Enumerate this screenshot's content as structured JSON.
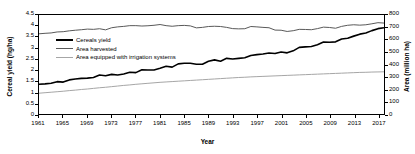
{
  "chart_data": {
    "type": "line",
    "title": "",
    "xlabel": "Year",
    "ylabel": "Cereal yield (hg/ha)",
    "ylabel_right": "Area (million ha)",
    "xlim": [
      1961,
      2018
    ],
    "ylim": [
      0,
      4.5
    ],
    "ylim_right": [
      0,
      800
    ],
    "grid": false,
    "legend_position": "upper-left-inside",
    "xticks": [
      "1961",
      "1965",
      "1969",
      "1973",
      "1977",
      "1981",
      "1985",
      "1989",
      "1993",
      "1997",
      "2001",
      "2005",
      "2009",
      "2013",
      "2017"
    ],
    "yticks_left": [
      "0",
      "0.5",
      "1",
      "1.5",
      "2",
      "2.5",
      "3",
      "3.5",
      "4",
      "4.5"
    ],
    "yticks_right": [
      "0",
      "100",
      "200",
      "300",
      "400",
      "500",
      "600",
      "700",
      "800"
    ],
    "x": [
      1961,
      1962,
      1963,
      1964,
      1965,
      1966,
      1967,
      1968,
      1969,
      1970,
      1971,
      1972,
      1973,
      1974,
      1975,
      1976,
      1977,
      1978,
      1979,
      1980,
      1981,
      1982,
      1983,
      1984,
      1985,
      1986,
      1987,
      1988,
      1989,
      1990,
      1991,
      1992,
      1993,
      1994,
      1995,
      1996,
      1997,
      1998,
      1999,
      2000,
      2001,
      2002,
      2003,
      2004,
      2005,
      2006,
      2007,
      2008,
      2009,
      2010,
      2011,
      2012,
      2013,
      2014,
      2015,
      2016,
      2017,
      2018
    ],
    "series": [
      {
        "name": "Cereals yield",
        "axis": "left",
        "unit": "hg/ha",
        "color": "#000000",
        "linewidth": 1.6,
        "values": [
          1.35,
          1.37,
          1.4,
          1.47,
          1.45,
          1.55,
          1.59,
          1.62,
          1.63,
          1.66,
          1.77,
          1.74,
          1.8,
          1.77,
          1.82,
          1.9,
          1.88,
          2.01,
          2.0,
          2.0,
          2.08,
          2.17,
          2.13,
          2.28,
          2.31,
          2.31,
          2.26,
          2.26,
          2.4,
          2.46,
          2.4,
          2.53,
          2.5,
          2.53,
          2.56,
          2.66,
          2.7,
          2.73,
          2.77,
          2.75,
          2.82,
          2.78,
          2.87,
          3.03,
          3.05,
          3.07,
          3.15,
          3.27,
          3.26,
          3.28,
          3.41,
          3.44,
          3.54,
          3.63,
          3.68,
          3.79,
          3.88,
          3.92
        ]
      },
      {
        "name": "Area harvested",
        "axis": "right",
        "unit": "million ha",
        "color": "#595959",
        "linewidth": 1.0,
        "values": [
          648,
          652,
          655,
          663,
          665,
          672,
          677,
          681,
          686,
          684,
          689,
          680,
          697,
          704,
          708,
          714,
          714,
          711,
          713,
          717,
          723,
          714,
          709,
          714,
          716,
          712,
          696,
          700,
          707,
          709,
          707,
          700,
          690,
          688,
          689,
          707,
          704,
          700,
          697,
          678,
          677,
          667,
          673,
          684,
          683,
          681,
          690,
          702,
          699,
          693,
          708,
          717,
          721,
          718,
          721,
          729,
          738,
          735
        ]
      },
      {
        "name": "Area equipped with irrigation systems",
        "axis": "right",
        "unit": "million ha",
        "color": "#A6A6A6",
        "linewidth": 1.0,
        "values": [
          168,
          172,
          176,
          180,
          184,
          189,
          193,
          198,
          202,
          207,
          212,
          216,
          221,
          226,
          231,
          235,
          240,
          244,
          248,
          252,
          256,
          259,
          262,
          265,
          268,
          271,
          274,
          277,
          280,
          283,
          286,
          289,
          292,
          295,
          297,
          300,
          302,
          304,
          306,
          308,
          310,
          312,
          314,
          316,
          318,
          320,
          322,
          324,
          326,
          328,
          330,
          332,
          334,
          336,
          337,
          339,
          340,
          341
        ]
      }
    ]
  }
}
